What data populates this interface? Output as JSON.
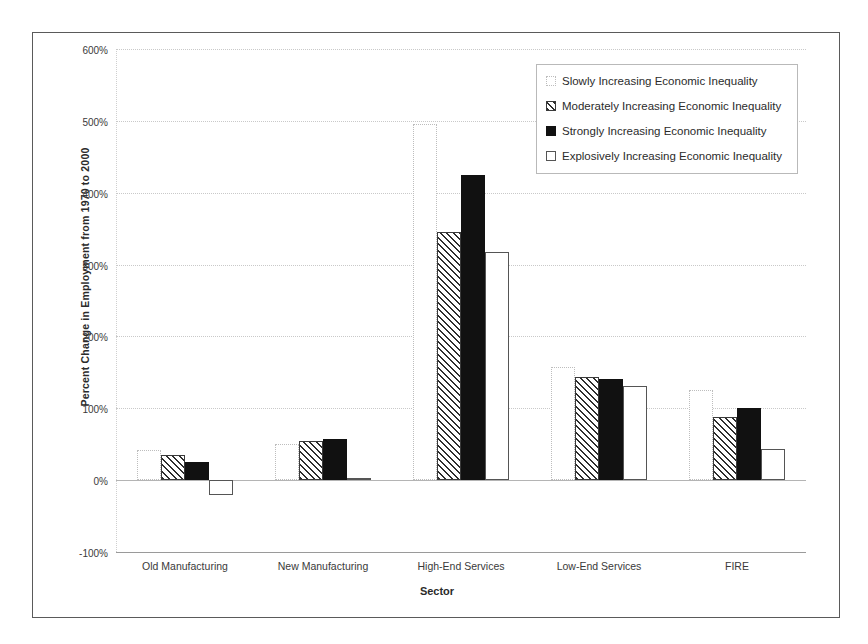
{
  "chart_data": {
    "type": "bar",
    "title": "",
    "xlabel": "Sector",
    "ylabel": "Percent Change in Employment from 1970 to 2000",
    "categories": [
      "Old Manufacturing",
      "New Manufacturing",
      "High-End Services",
      "Low-End Services",
      "FIRE"
    ],
    "series": [
      {
        "name": "Slowly Increasing Economic Inequality",
        "values": [
          42,
          50,
          495,
          158,
          125
        ],
        "swatch": "light-dotted-outline"
      },
      {
        "name": "Moderately Increasing Economic Inequality",
        "values": [
          35,
          55,
          345,
          143,
          88
        ],
        "swatch": "diagonal-hatch"
      },
      {
        "name": "Strongly Increasing Economic Inequality",
        "values": [
          25,
          57,
          425,
          141,
          101
        ],
        "swatch": "solid-black"
      },
      {
        "name": "Explosively Increasing Economic Inequality",
        "values": [
          -20,
          3,
          318,
          131,
          44
        ],
        "swatch": "white-outline"
      }
    ],
    "ylim": [
      -100,
      600
    ],
    "yticks": [
      600,
      500,
      400,
      300,
      200,
      100,
      0,
      -100
    ],
    "ytick_labels": [
      "600%",
      "500%",
      "400%",
      "300%",
      "200%",
      "100%",
      "0%",
      "-100%"
    ],
    "grid": true,
    "legend_position": "upper right",
    "value_unit": "percent"
  },
  "legend": {
    "items": [
      {
        "label": "Slowly Increasing Economic Inequality"
      },
      {
        "label": "Moderately Increasing Economic Inequality"
      },
      {
        "label": "Strongly Increasing Economic Inequality"
      },
      {
        "label": "Explosively Increasing Economic Inequality"
      }
    ]
  }
}
